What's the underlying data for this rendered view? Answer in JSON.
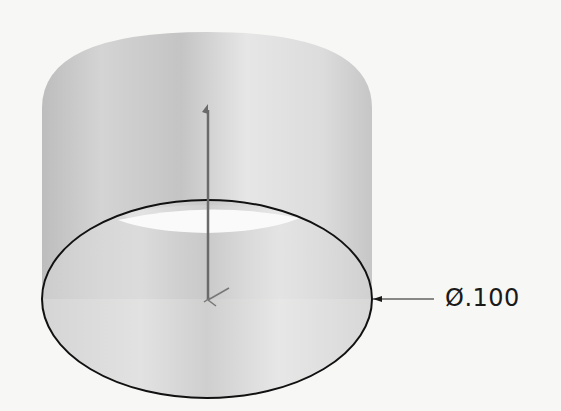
{
  "diagram": {
    "type": "3d-cad-view",
    "dimension": {
      "symbol": "Ø",
      "value": ".100",
      "text": "Ø.100"
    },
    "colors": {
      "background": "#f7f7f5",
      "cylinder_light": "#e8e8e8",
      "cylinder_dark": "#b8b8b8",
      "sketch_line": "#111111",
      "axis_line": "#6a6a6a"
    }
  }
}
